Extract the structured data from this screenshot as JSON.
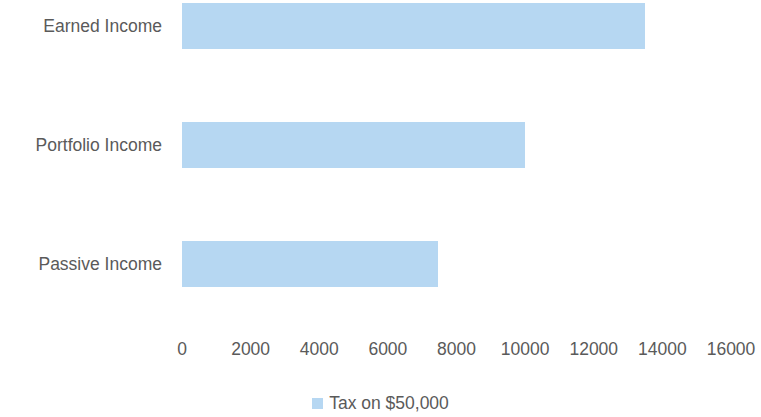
{
  "chart_data": {
    "type": "bar",
    "orientation": "horizontal",
    "title": "",
    "subtitle": "",
    "xlabel": "",
    "ylabel": "",
    "categories": [
      "Earned Income",
      "Portfolio Income",
      "Passive Income"
    ],
    "series": [
      {
        "name": "Tax on $50,000",
        "color": "#b6d7f2",
        "values": [
          13500,
          10000,
          7450
        ]
      }
    ],
    "xlim": [
      0,
      16000
    ],
    "xticks": [
      0,
      2000,
      4000,
      6000,
      8000,
      10000,
      12000,
      14000,
      16000
    ],
    "xtick_labels": [
      "0",
      "2000",
      "4000",
      "6000",
      "8000",
      "10000",
      "12000",
      "14000",
      "16000"
    ],
    "grid": false,
    "legend": {
      "position": "bottom",
      "entries": [
        {
          "label": "Tax on $50,000",
          "color": "#b6d7f2"
        }
      ]
    },
    "colors": {
      "bar_fill": "#b6d7f2",
      "text": "#5a5a5a",
      "background": "#ffffff"
    }
  }
}
